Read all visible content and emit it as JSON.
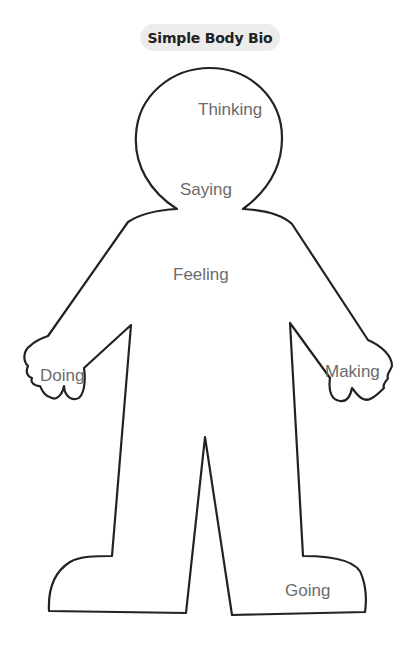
{
  "title": "Simple Body Bio",
  "figure": {
    "outline_color": "#222222",
    "label_color": "#6b6b6b",
    "labels": {
      "head": "Thinking",
      "mouth": "Saying",
      "chest": "Feeling",
      "left_hand": "Doing",
      "right_hand": "Making",
      "feet": "Going"
    }
  }
}
